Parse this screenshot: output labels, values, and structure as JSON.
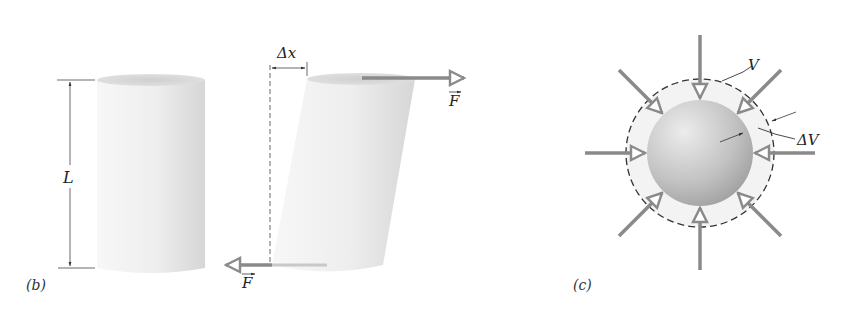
{
  "panels": {
    "b": {
      "label": "(b)",
      "length_label": "L",
      "displacement_label": "Δx",
      "force_top_label": "F",
      "force_bottom_label": "F",
      "description": "Shear stress: cylinder of length L sheared by opposite forces F, top displaced by Δx"
    },
    "c": {
      "label": "(c)",
      "volume_label": "V",
      "volume_change_label": "ΔV",
      "description": "Hydraulic stress: sphere compressed uniformly from volume V by ΔV"
    }
  },
  "colors": {
    "arrow": "#8a8a8a",
    "cylinder_light": "#f2f2f2",
    "cylinder_shade": "#d4d4d4",
    "sphere_light": "#e0e0e0",
    "sphere_dark": "#a8a8a8",
    "outer_shell": "#f3f3f3",
    "line": "#333333"
  }
}
